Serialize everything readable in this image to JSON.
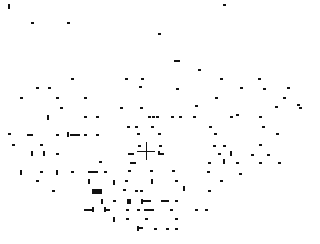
{
  "canvas": {
    "width": 320,
    "height": 244,
    "background": "#ffffff",
    "mark_color": "#111111"
  },
  "crosshair": {
    "x": 146,
    "y": 151,
    "size": 18
  },
  "marks": [
    [
      8,
      4,
      2,
      5
    ],
    [
      31,
      22,
      3,
      2
    ],
    [
      67,
      22,
      3,
      2
    ],
    [
      158,
      33,
      3,
      2
    ],
    [
      223,
      4,
      3,
      2
    ],
    [
      174,
      60,
      6,
      2
    ],
    [
      198,
      69,
      3,
      2
    ],
    [
      71,
      78,
      3,
      2
    ],
    [
      125,
      78,
      3,
      2
    ],
    [
      141,
      78,
      3,
      2
    ],
    [
      220,
      78,
      3,
      2
    ],
    [
      258,
      78,
      3,
      2
    ],
    [
      36,
      87,
      3,
      2
    ],
    [
      48,
      87,
      3,
      2
    ],
    [
      139,
      86,
      3,
      2
    ],
    [
      176,
      88,
      3,
      2
    ],
    [
      240,
      87,
      3,
      2
    ],
    [
      263,
      88,
      3,
      2
    ],
    [
      287,
      87,
      3,
      2
    ],
    [
      20,
      97,
      3,
      2
    ],
    [
      56,
      97,
      3,
      2
    ],
    [
      84,
      97,
      3,
      2
    ],
    [
      215,
      97,
      3,
      2
    ],
    [
      283,
      97,
      3,
      2
    ],
    [
      297,
      104,
      3,
      2
    ],
    [
      60,
      107,
      3,
      2
    ],
    [
      120,
      107,
      3,
      2
    ],
    [
      140,
      107,
      3,
      2
    ],
    [
      195,
      105,
      3,
      2
    ],
    [
      275,
      106,
      3,
      2
    ],
    [
      299,
      107,
      3,
      2
    ],
    [
      47,
      115,
      2,
      5
    ],
    [
      84,
      116,
      3,
      2
    ],
    [
      96,
      116,
      3,
      2
    ],
    [
      148,
      116,
      3,
      2
    ],
    [
      152,
      116,
      3,
      2
    ],
    [
      156,
      116,
      3,
      2
    ],
    [
      171,
      116,
      3,
      2
    ],
    [
      179,
      116,
      3,
      2
    ],
    [
      193,
      116,
      3,
      2
    ],
    [
      230,
      116,
      3,
      2
    ],
    [
      236,
      114,
      3,
      2
    ],
    [
      259,
      116,
      3,
      2
    ],
    [
      127,
      126,
      3,
      2
    ],
    [
      135,
      126,
      3,
      2
    ],
    [
      151,
      126,
      3,
      2
    ],
    [
      209,
      126,
      3,
      2
    ],
    [
      262,
      126,
      3,
      2
    ],
    [
      8,
      133,
      3,
      2
    ],
    [
      27,
      134,
      6,
      2
    ],
    [
      56,
      134,
      3,
      2
    ],
    [
      67,
      132,
      2,
      5
    ],
    [
      70,
      134,
      10,
      2
    ],
    [
      84,
      134,
      3,
      2
    ],
    [
      96,
      134,
      3,
      2
    ],
    [
      137,
      133,
      3,
      2
    ],
    [
      158,
      133,
      3,
      2
    ],
    [
      214,
      133,
      3,
      2
    ],
    [
      276,
      133,
      3,
      2
    ],
    [
      12,
      144,
      3,
      2
    ],
    [
      40,
      144,
      3,
      2
    ],
    [
      138,
      145,
      3,
      2
    ],
    [
      159,
      145,
      3,
      2
    ],
    [
      213,
      145,
      3,
      2
    ],
    [
      223,
      145,
      3,
      2
    ],
    [
      259,
      144,
      3,
      2
    ],
    [
      31,
      151,
      2,
      5
    ],
    [
      43,
      151,
      2,
      5
    ],
    [
      56,
      153,
      3,
      2
    ],
    [
      128,
      153,
      6,
      2
    ],
    [
      158,
      151,
      2,
      4
    ],
    [
      160,
      153,
      4,
      2
    ],
    [
      218,
      153,
      3,
      2
    ],
    [
      230,
      151,
      2,
      5
    ],
    [
      251,
      154,
      3,
      2
    ],
    [
      267,
      154,
      3,
      2
    ],
    [
      99,
      161,
      3,
      2
    ],
    [
      130,
      162,
      6,
      2
    ],
    [
      208,
      162,
      3,
      2
    ],
    [
      236,
      162,
      3,
      2
    ],
    [
      259,
      162,
      3,
      2
    ],
    [
      278,
      162,
      3,
      2
    ],
    [
      20,
      170,
      2,
      5
    ],
    [
      40,
      171,
      3,
      2
    ],
    [
      56,
      170,
      2,
      5
    ],
    [
      71,
      171,
      3,
      2
    ],
    [
      88,
      171,
      10,
      2
    ],
    [
      104,
      171,
      3,
      2
    ],
    [
      128,
      170,
      3,
      2
    ],
    [
      150,
      170,
      3,
      2
    ],
    [
      172,
      170,
      3,
      2
    ],
    [
      207,
      171,
      3,
      2
    ],
    [
      223,
      159,
      2,
      5
    ],
    [
      239,
      173,
      3,
      2
    ],
    [
      36,
      180,
      3,
      2
    ],
    [
      88,
      179,
      2,
      5
    ],
    [
      113,
      180,
      2,
      5
    ],
    [
      125,
      180,
      3,
      2
    ],
    [
      151,
      179,
      2,
      5
    ],
    [
      175,
      180,
      3,
      2
    ],
    [
      220,
      180,
      3,
      2
    ],
    [
      52,
      190,
      3,
      2
    ],
    [
      92,
      189,
      10,
      5
    ],
    [
      123,
      189,
      3,
      2
    ],
    [
      135,
      190,
      3,
      2
    ],
    [
      140,
      190,
      3,
      2
    ],
    [
      183,
      186,
      2,
      5
    ],
    [
      208,
      190,
      3,
      2
    ],
    [
      101,
      199,
      2,
      5
    ],
    [
      113,
      200,
      3,
      2
    ],
    [
      127,
      199,
      4,
      5
    ],
    [
      141,
      199,
      2,
      5
    ],
    [
      143,
      200,
      8,
      2
    ],
    [
      161,
      200,
      8,
      2
    ],
    [
      175,
      200,
      3,
      2
    ],
    [
      84,
      209,
      8,
      2
    ],
    [
      92,
      207,
      2,
      5
    ],
    [
      104,
      207,
      2,
      5
    ],
    [
      106,
      209,
      4,
      2
    ],
    [
      126,
      209,
      3,
      2
    ],
    [
      137,
      209,
      3,
      2
    ],
    [
      144,
      209,
      10,
      2
    ],
    [
      170,
      209,
      3,
      2
    ],
    [
      195,
      209,
      3,
      2
    ],
    [
      205,
      209,
      3,
      2
    ],
    [
      113,
      217,
      2,
      5
    ],
    [
      126,
      218,
      3,
      2
    ],
    [
      145,
      218,
      3,
      2
    ],
    [
      175,
      218,
      3,
      2
    ],
    [
      137,
      226,
      2,
      5
    ],
    [
      139,
      227,
      4,
      2
    ],
    [
      154,
      228,
      3,
      2
    ],
    [
      166,
      228,
      3,
      2
    ],
    [
      175,
      228,
      3,
      2
    ]
  ]
}
